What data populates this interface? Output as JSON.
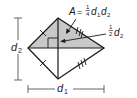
{
  "figure": {
    "shape": "rhombus",
    "fill_color": "#c8c8c8",
    "stroke_color": "#1a1a1a",
    "labels": {
      "area_formula": {
        "lhs": "A",
        "equals": "=",
        "frac_num": "1",
        "frac_den": "4",
        "var1": "d",
        "sub1": "1",
        "var2": "d",
        "sub2": "2"
      },
      "half_diagonal": {
        "frac_num": "1",
        "frac_den": "2",
        "var": "d",
        "sub": "2"
      },
      "diagonal_vertical": {
        "var": "d",
        "sub": "2"
      },
      "diagonal_horizontal": {
        "var": "d",
        "sub": "1"
      }
    },
    "annotations": [
      "congruent-side tick marks (single on left sides, double on right sides)",
      "right-angle marker at diagonal intersection",
      "shaded upper triangle"
    ]
  }
}
